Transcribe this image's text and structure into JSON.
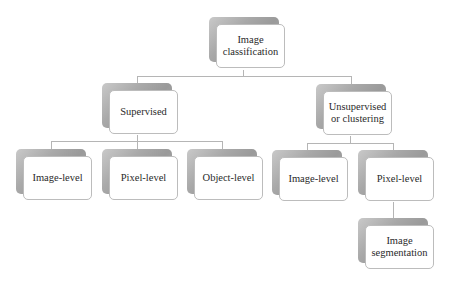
{
  "diagram": {
    "root": {
      "label": "Image\nclassification"
    },
    "level1": [
      {
        "label": "Supervised"
      },
      {
        "label": "Unsupervised\nor clustering"
      }
    ],
    "supervised_children": [
      {
        "label": "Image-level"
      },
      {
        "label": "Pixel-level"
      },
      {
        "label": "Object-level"
      }
    ],
    "unsupervised_children": [
      {
        "label": "Image-level"
      },
      {
        "label": "Pixel-level"
      }
    ],
    "pixel_level_children": [
      {
        "label": "Image\nsegmentation"
      }
    ],
    "colors": {
      "shadow": "#a5a5a5",
      "card_border": "#bcbcbc",
      "connector": "#b5b5b5",
      "text": "#2a2a2a"
    }
  }
}
